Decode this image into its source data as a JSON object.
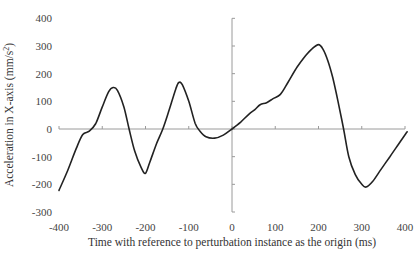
{
  "chart_data": {
    "type": "line",
    "title": "",
    "xlabel": "Time with reference to perturbation instance as the origin (ms)",
    "ylabel": "Acceleration in X-axis (mm/s²)",
    "ylabel_parts": {
      "main": "Acceleration in X-axis (mm/s",
      "sup": "2",
      "end": ")"
    },
    "xlim": [
      -400,
      400
    ],
    "ylim": [
      -300,
      400
    ],
    "x_ticks": [
      -400,
      -300,
      -200,
      -100,
      0,
      100,
      200,
      300,
      400
    ],
    "y_ticks": [
      400,
      300,
      200,
      100,
      0,
      -100,
      -200,
      -300
    ],
    "grid": false,
    "legend": null,
    "series": [
      {
        "name": "Acceleration X",
        "color": "#222222",
        "x": [
          -400,
          -380,
          -360,
          -345,
          -330,
          -315,
          -300,
          -285,
          -275,
          -265,
          -250,
          -238,
          -225,
          -210,
          -200,
          -190,
          -175,
          -160,
          -145,
          -130,
          -123,
          -115,
          -100,
          -85,
          -74,
          -60,
          -40,
          -20,
          0,
          20,
          40,
          53,
          65,
          80,
          95,
          112,
          130,
          151,
          170,
          185,
          200,
          210,
          222,
          233,
          245,
          258,
          270,
          285,
          300,
          310,
          325,
          345,
          365,
          385,
          405
        ],
        "y": [
          -222,
          -150,
          -70,
          -20,
          -8,
          20,
          80,
          135,
          150,
          140,
          80,
          0,
          -80,
          -140,
          -160,
          -120,
          -55,
          0,
          70,
          145,
          168,
          160,
          100,
          20,
          -8,
          -28,
          -33,
          -22,
          0,
          25,
          55,
          70,
          88,
          95,
          110,
          125,
          170,
          225,
          265,
          290,
          305,
          290,
          245,
          185,
          100,
          0,
          -100,
          -165,
          -200,
          -210,
          -190,
          -145,
          -100,
          -55,
          -10
        ]
      }
    ]
  },
  "plot_box": {
    "x0": 59,
    "x1": 405,
    "y_top": 19,
    "y_zero": 129,
    "y_bottom": 212
  }
}
